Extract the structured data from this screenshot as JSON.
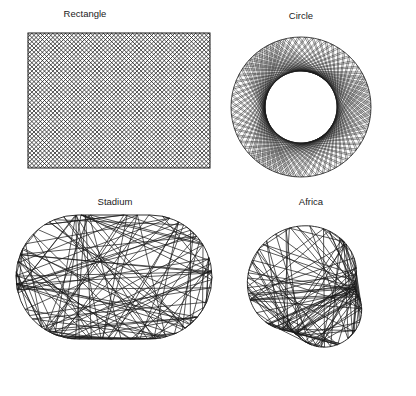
{
  "figure": {
    "panels": [
      {
        "id": "rectangle",
        "title": "Rectangle",
        "title_x": 85,
        "title_y": 15,
        "shape": {
          "type": "rect",
          "x": 28,
          "y": 33,
          "w": 182,
          "h": 135
        }
      },
      {
        "id": "circle",
        "title": "Circle",
        "title_x": 271,
        "title_y": 17,
        "shape": {
          "type": "circle",
          "cx": 301,
          "cy": 107,
          "r": 70,
          "inner_r": 36
        }
      },
      {
        "id": "stadium",
        "title": "Stadium",
        "title_x": 87,
        "title_y": 199,
        "shape": {
          "type": "stadium",
          "x1": 78,
          "x2": 150,
          "cy": 277,
          "r": 62
        }
      },
      {
        "id": "africa",
        "title": "Africa",
        "title_x": 287,
        "title_y": 199,
        "shape": {
          "type": "africa",
          "cx": 315,
          "cy": 297,
          "r": 78
        }
      }
    ],
    "line_color": "#1a1a1a",
    "background": "#ffffff"
  }
}
